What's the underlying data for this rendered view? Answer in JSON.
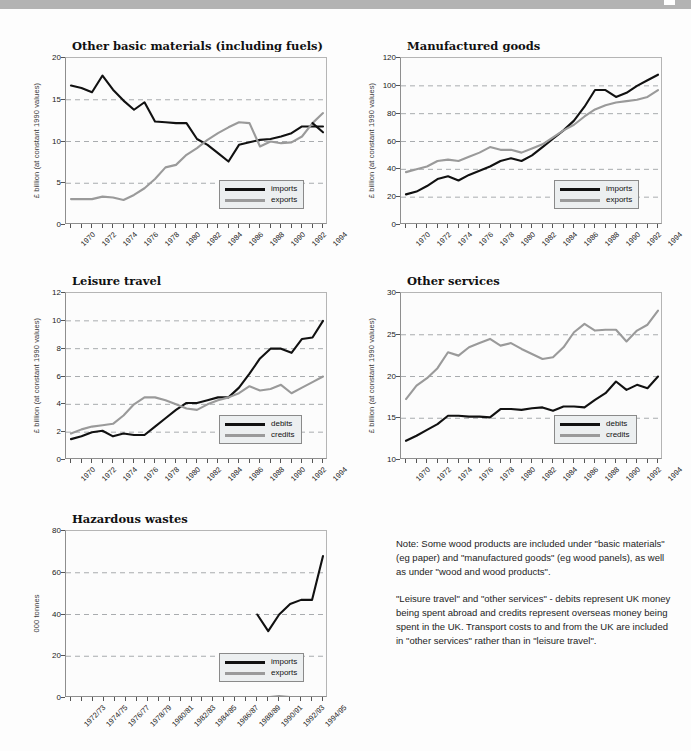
{
  "page": {
    "background_color": "#fdfdfd",
    "topbar_color": "#b3b3b3"
  },
  "series_colors": {
    "dark": "#111111",
    "gray": "#9a9a9a"
  },
  "notes": {
    "paragraph_1": "Note: Some wood products are included under \"basic materials\" (eg paper) and \"manufactured goods\" (eg wood panels), as well as under \"wood and wood products\".",
    "paragraph_2": "\"Leisure travel\" and \"other services\" - debits represent UK money being spent abroad and credits represent overseas money being spent in the UK. Transport costs to and from the UK are included in \"other services\" rather than in \"leisure travel\"."
  },
  "chart_data": [
    {
      "id": "other-basic-materials",
      "type": "line",
      "title": "Other basic materials (including fuels)",
      "xlabel": "",
      "ylabel": "£ billion (at constant 1990 values)",
      "ylim": [
        0,
        20
      ],
      "yticks": [
        0,
        5,
        10,
        15,
        20
      ],
      "grid": true,
      "legend_position": "bottom-right",
      "x": [
        1970,
        1971,
        1972,
        1973,
        1974,
        1975,
        1976,
        1977,
        1978,
        1979,
        1980,
        1981,
        1982,
        1983,
        1984,
        1985,
        1986,
        1987,
        1988,
        1989,
        1990,
        1991,
        1992,
        1993,
        1994
      ],
      "xticklabels": [
        "1970",
        "1972",
        "1974",
        "1976",
        "1978",
        "1980",
        "1982",
        "1984",
        "1986",
        "1988",
        "1990",
        "1992",
        "1994"
      ],
      "series": [
        {
          "name": "imports",
          "color": "#111111",
          "values": [
            16.7,
            16.4,
            15.9,
            17.9,
            16.2,
            14.9,
            13.8,
            14.7,
            12.4,
            12.3,
            12.2,
            12.2,
            10.3,
            9.6,
            8.6,
            7.6,
            9.6,
            9.9,
            10.2,
            10.3,
            10.6,
            11.0,
            11.8,
            11.8,
            11.8
          ]
        },
        {
          "name": "exports",
          "color": "#9a9a9a",
          "values": [
            3.1,
            3.1,
            3.1,
            3.4,
            3.3,
            3.0,
            3.6,
            4.4,
            5.5,
            6.9,
            7.2,
            8.4,
            9.2,
            10.2,
            11.0,
            11.7,
            12.3,
            12.2,
            9.4,
            10.0,
            9.8,
            9.9,
            10.6,
            12.2,
            13.4
          ]
        }
      ],
      "imports_tail": [
        12.2,
        11.1
      ]
    },
    {
      "id": "manufactured-goods",
      "type": "line",
      "title": "Manufactured goods",
      "xlabel": "",
      "ylabel": "£ billion (at constant 1990 values)",
      "ylim": [
        0,
        120
      ],
      "yticks": [
        0,
        20,
        40,
        60,
        80,
        100,
        120
      ],
      "grid": true,
      "legend_position": "bottom-right",
      "x": [
        1970,
        1971,
        1972,
        1973,
        1974,
        1975,
        1976,
        1977,
        1978,
        1979,
        1980,
        1981,
        1982,
        1983,
        1984,
        1985,
        1986,
        1987,
        1988,
        1989,
        1990,
        1991,
        1992,
        1993,
        1994
      ],
      "xticklabels": [
        "1970",
        "1972",
        "1974",
        "1976",
        "1978",
        "1980",
        "1982",
        "1984",
        "1986",
        "1988",
        "1990",
        "1992",
        "1994"
      ],
      "series": [
        {
          "name": "imports",
          "color": "#111111",
          "values": [
            22,
            24,
            28,
            33,
            35,
            32,
            36,
            39,
            42,
            46,
            48,
            46,
            50,
            56,
            62,
            68,
            75,
            85,
            97,
            97,
            92,
            95,
            100,
            104,
            108
          ]
        },
        {
          "name": "exports",
          "color": "#9a9a9a",
          "values": [
            38,
            40,
            42,
            46,
            47,
            46,
            49,
            52,
            56,
            54,
            54,
            52,
            55,
            58,
            63,
            68,
            72,
            78,
            83,
            86,
            88,
            89,
            90,
            92,
            97
          ]
        }
      ]
    },
    {
      "id": "leisure-travel",
      "type": "line",
      "title": "Leisure travel",
      "xlabel": "",
      "ylabel": "£ billion (at constant 1990 values)",
      "ylim": [
        0,
        12
      ],
      "yticks": [
        0,
        2,
        4,
        6,
        8,
        10,
        12
      ],
      "grid": true,
      "legend_position": "bottom-right",
      "x": [
        1970,
        1971,
        1972,
        1973,
        1974,
        1975,
        1976,
        1977,
        1978,
        1979,
        1980,
        1981,
        1982,
        1983,
        1984,
        1985,
        1986,
        1987,
        1988,
        1989,
        1990,
        1991,
        1992,
        1993,
        1994
      ],
      "xticklabels": [
        "1970",
        "1972",
        "1974",
        "1976",
        "1978",
        "1980",
        "1982",
        "1984",
        "1986",
        "1988",
        "1990",
        "1992",
        "1994"
      ],
      "series": [
        {
          "name": "debits",
          "color": "#111111",
          "values": [
            1.5,
            1.7,
            2.0,
            2.1,
            1.7,
            1.9,
            1.8,
            1.8,
            2.4,
            3.0,
            3.6,
            4.1,
            4.1,
            4.3,
            4.5,
            4.5,
            5.2,
            6.2,
            7.3,
            8.0,
            8.0,
            7.7,
            8.7,
            8.8,
            10.0
          ]
        },
        {
          "name": "credits",
          "color": "#9a9a9a",
          "values": [
            1.9,
            2.2,
            2.4,
            2.5,
            2.6,
            3.2,
            4.0,
            4.5,
            4.5,
            4.3,
            4.0,
            3.7,
            3.6,
            4.0,
            4.3,
            4.5,
            4.8,
            5.3,
            5.0,
            5.1,
            5.4,
            4.8,
            5.2,
            5.6,
            6.0
          ]
        }
      ]
    },
    {
      "id": "other-services",
      "type": "line",
      "title": "Other services",
      "xlabel": "",
      "ylabel": "£ billion (at constant 1990 values)",
      "ylim": [
        10,
        30
      ],
      "yticks": [
        10,
        15,
        20,
        25,
        30
      ],
      "grid": true,
      "legend_position": "bottom-right",
      "x": [
        1970,
        1971,
        1972,
        1973,
        1974,
        1975,
        1976,
        1977,
        1978,
        1979,
        1980,
        1981,
        1982,
        1983,
        1984,
        1985,
        1986,
        1987,
        1988,
        1989,
        1990,
        1991,
        1992,
        1993,
        1994
      ],
      "xticklabels": [
        "1970",
        "1972",
        "1974",
        "1976",
        "1978",
        "1980",
        "1982",
        "1984",
        "1986",
        "1988",
        "1990",
        "1992",
        "1994"
      ],
      "series": [
        {
          "name": "debits",
          "color": "#111111",
          "values": [
            12.3,
            12.9,
            13.6,
            14.3,
            15.3,
            15.3,
            15.2,
            15.2,
            15.1,
            16.1,
            16.1,
            16.0,
            16.2,
            16.3,
            15.9,
            16.4,
            16.4,
            16.3,
            17.2,
            18.0,
            19.4,
            18.4,
            19.0,
            18.6,
            20.0
          ]
        },
        {
          "name": "credits",
          "color": "#9a9a9a",
          "values": [
            17.3,
            18.9,
            19.8,
            21.0,
            22.9,
            22.5,
            23.5,
            24.0,
            24.5,
            23.7,
            24.0,
            23.3,
            22.7,
            22.1,
            22.3,
            23.5,
            25.3,
            26.3,
            25.5,
            25.6,
            25.6,
            24.2,
            25.5,
            26.2,
            27.9
          ]
        }
      ]
    },
    {
      "id": "hazardous-wastes",
      "type": "line",
      "title": "Hazardous wastes",
      "xlabel": "",
      "ylabel": "000 tonnes",
      "ylim": [
        0,
        80
      ],
      "yticks": [
        0,
        20,
        40,
        60,
        80
      ],
      "grid": true,
      "legend_position": "bottom-right",
      "x": [
        "1971/72",
        "1972/73",
        "1973/74",
        "1974/75",
        "1975/76",
        "1976/77",
        "1977/78",
        "1978/79",
        "1979/80",
        "1980/81",
        "1981/82",
        "1982/83",
        "1983/84",
        "1984/85",
        "1985/86",
        "1986/87",
        "1987/88",
        "1988/89",
        "1989/90",
        "1990/91",
        "1991/92",
        "1992/93",
        "1993/94",
        "1994/95"
      ],
      "xticklabels": [
        "1972/73",
        "1974/75",
        "1976/77",
        "1978/79",
        "1980/81",
        "1982/83",
        "1984/85",
        "1986/87",
        "1988/89",
        "1990/91",
        "1992/93",
        "1994/95"
      ],
      "series": [
        {
          "name": "imports",
          "color": "#111111",
          "values": [
            null,
            null,
            null,
            null,
            null,
            null,
            null,
            null,
            null,
            null,
            null,
            null,
            null,
            null,
            null,
            null,
            null,
            40,
            32,
            40,
            45,
            47,
            47,
            68
          ]
        },
        {
          "name": "exports",
          "color": "#9a9a9a",
          "values": [
            null,
            null,
            null,
            null,
            null,
            null,
            null,
            null,
            null,
            null,
            null,
            null,
            null,
            null,
            null,
            null,
            null,
            0.3,
            0.4,
            0.9,
            0.5,
            0.4,
            0.4,
            0.4
          ]
        }
      ]
    }
  ]
}
